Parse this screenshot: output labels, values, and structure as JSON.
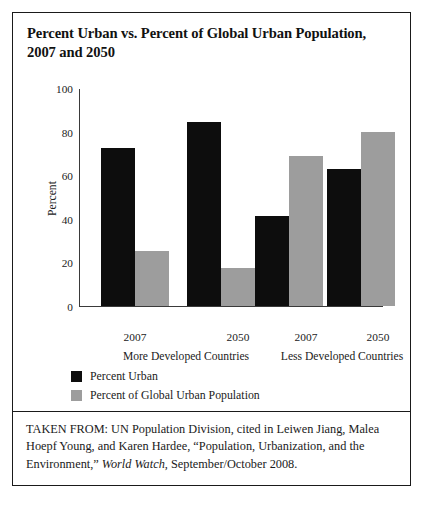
{
  "figure": {
    "title": "Percent Urban vs. Percent of Global Urban Population, 2007 and 2050",
    "source_prefix": "TAKEN FROM: UN Population Division, cited in Leiwen Jiang, Malea Hoepf Young, and Karen Hardee, “Population, Urbanization, and the Environment,” ",
    "source_italic": "World Watch",
    "source_suffix": ", September/October 2008."
  },
  "colors": {
    "percent_urban": "#0d0d0d",
    "percent_global_urban_population": "#9d9d9d",
    "frame": "#1a1a1a",
    "axis": "#3a3a3a",
    "background": "#ffffff"
  },
  "chart_data": {
    "type": "bar",
    "title": "Percent Urban vs. Percent of Global Urban Population, 2007 and 2050",
    "xlabel": "",
    "ylabel": "Percent",
    "ylim": [
      0,
      100
    ],
    "yticks": [
      0,
      20,
      40,
      60,
      80,
      100
    ],
    "ytick_labels": [
      "0",
      "20",
      "40",
      "60",
      "80",
      "100"
    ],
    "grid": false,
    "legend_position": "below-plot-left",
    "categories": [
      "2007",
      "2050",
      "2007",
      "2050"
    ],
    "groups": [
      {
        "name": "More Developed Countries",
        "categories": [
          "2007",
          "2050"
        ]
      },
      {
        "name": "Less Developed Countries",
        "categories": [
          "2007",
          "2050"
        ]
      }
    ],
    "series": [
      {
        "name": "Percent Urban",
        "color": "#0d0d0d",
        "values": [
          73,
          85,
          41.5,
          63
        ]
      },
      {
        "name": "Percent of Global Urban Population",
        "color": "#9d9d9d",
        "values": [
          25,
          17.5,
          69,
          80
        ]
      }
    ],
    "bars": [
      {
        "group": "More Developed Countries",
        "category": "2007",
        "series": "Percent Urban",
        "value": 73
      },
      {
        "group": "More Developed Countries",
        "category": "2007",
        "series": "Percent of Global Urban Population",
        "value": 25
      },
      {
        "group": "More Developed Countries",
        "category": "2050",
        "series": "Percent Urban",
        "value": 85
      },
      {
        "group": "More Developed Countries",
        "category": "2050",
        "series": "Percent of Global Urban Population",
        "value": 17.5
      },
      {
        "group": "Less Developed Countries",
        "category": "2007",
        "series": "Percent Urban",
        "value": 41.5
      },
      {
        "group": "Less Developed Countries",
        "category": "2007",
        "series": "Percent of Global Urban Population",
        "value": 69
      },
      {
        "group": "Less Developed Countries",
        "category": "2050",
        "series": "Percent Urban",
        "value": 63
      },
      {
        "group": "Less Developed Countries",
        "category": "2050",
        "series": "Percent of Global Urban Population",
        "value": 80
      }
    ]
  }
}
